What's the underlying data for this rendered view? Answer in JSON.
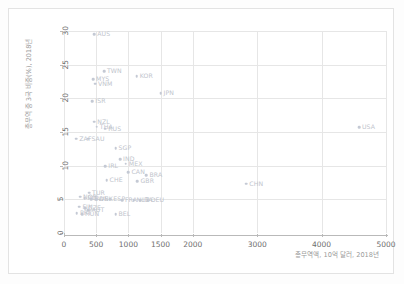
{
  "chart_data": {
    "type": "scatter",
    "title": "",
    "xlabel": "총무역액, 10억 달러, 2018년",
    "ylabel": "총무역 중 3국 비중(%), 2018년",
    "xlim": [
      0,
      5000
    ],
    "ylim": [
      0,
      30
    ],
    "xticks": [
      0,
      500,
      1000,
      1500,
      2000,
      3000,
      4000,
      5000
    ],
    "yticks": [
      0,
      5,
      10,
      15,
      20,
      25,
      30
    ],
    "grid": true,
    "legend": "none",
    "marker_color": "#c4c9d4",
    "label_color": "#c0c4cc",
    "points": [
      {
        "label": "AUS",
        "x": 470,
        "y": 29.5
      },
      {
        "label": "TWN",
        "x": 620,
        "y": 24.0
      },
      {
        "label": "KOR",
        "x": 1130,
        "y": 23.3
      },
      {
        "label": "MYS",
        "x": 450,
        "y": 22.8
      },
      {
        "label": "VNM",
        "x": 480,
        "y": 22.2
      },
      {
        "label": "JPN",
        "x": 1500,
        "y": 20.8
      },
      {
        "label": "ISR",
        "x": 440,
        "y": 19.6
      },
      {
        "label": "NZL",
        "x": 470,
        "y": 16.5
      },
      {
        "label": "THA",
        "x": 510,
        "y": 15.8
      },
      {
        "label": "RUS",
        "x": 640,
        "y": 15.5
      },
      {
        "label": "USA",
        "x": 4580,
        "y": 15.7
      },
      {
        "label": "ZAF",
        "x": 190,
        "y": 14.0
      },
      {
        "label": "SAU",
        "x": 380,
        "y": 14.0
      },
      {
        "label": "SGP",
        "x": 800,
        "y": 12.6
      },
      {
        "label": "IND",
        "x": 870,
        "y": 11.0
      },
      {
        "label": "MEX",
        "x": 960,
        "y": 10.3
      },
      {
        "label": "IRL",
        "x": 640,
        "y": 9.9
      },
      {
        "label": "CAN",
        "x": 1000,
        "y": 9.0
      },
      {
        "label": "BRA",
        "x": 1280,
        "y": 8.6
      },
      {
        "label": "CHE",
        "x": 660,
        "y": 7.8
      },
      {
        "label": "GBR",
        "x": 1140,
        "y": 7.7
      },
      {
        "label": "CHN",
        "x": 2830,
        "y": 7.3
      },
      {
        "label": "TUR",
        "x": 390,
        "y": 6.0
      },
      {
        "label": "NOR",
        "x": 250,
        "y": 5.4
      },
      {
        "label": "POL",
        "x": 320,
        "y": 5.2
      },
      {
        "label": "SWE",
        "x": 420,
        "y": 5.0
      },
      {
        "label": "DNK",
        "x": 500,
        "y": 5.0
      },
      {
        "label": "ESP",
        "x": 720,
        "y": 5.0
      },
      {
        "label": "FRA",
        "x": 900,
        "y": 4.9
      },
      {
        "label": "NLD",
        "x": 1080,
        "y": 4.9
      },
      {
        "label": "ITA",
        "x": 1180,
        "y": 4.9
      },
      {
        "label": "DEU",
        "x": 1300,
        "y": 4.9
      },
      {
        "label": "FIN",
        "x": 240,
        "y": 3.9
      },
      {
        "label": "CZE",
        "x": 330,
        "y": 3.7
      },
      {
        "label": "AUT",
        "x": 380,
        "y": 3.4
      },
      {
        "label": "PRT",
        "x": 200,
        "y": 2.9
      },
      {
        "label": "HUN",
        "x": 280,
        "y": 2.8
      },
      {
        "label": "BEL",
        "x": 800,
        "y": 2.8
      }
    ]
  }
}
